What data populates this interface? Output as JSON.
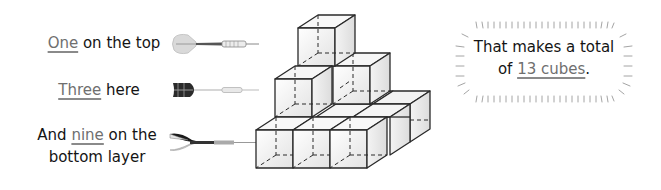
{
  "labels": {
    "top": {
      "highlight": "One",
      "rest": " on the top"
    },
    "middle": {
      "highlight": "Three",
      "rest": " here"
    },
    "bottom": {
      "prefix": "And ",
      "highlight": "nine",
      "rest_line1": " on the",
      "line2": "bottom layer"
    }
  },
  "darts": [
    {
      "name": "dart-light-flight",
      "style": "light-gray"
    },
    {
      "name": "dart-dark-patterned-flight",
      "style": "dark-patterned"
    },
    {
      "name": "dart-black-white-flight",
      "style": "black-white"
    }
  ],
  "cube_structure": {
    "layers": [
      {
        "name": "top",
        "count": 1
      },
      {
        "name": "middle",
        "count": 3
      },
      {
        "name": "bottom",
        "count": 9
      }
    ]
  },
  "callout": {
    "line1": "That makes a total",
    "prefix2": "of ",
    "highlight": "13 cubes",
    "suffix": "."
  },
  "colors": {
    "text": "#141414",
    "highlight": "#6f6f6f",
    "cube_edge": "#2a2a2a",
    "cube_fill": "#ececec"
  }
}
